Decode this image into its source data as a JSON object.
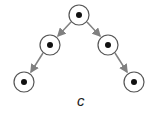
{
  "diagram": {
    "type": "binary-tree",
    "label": "c",
    "colors": {
      "node_stroke": "#555555",
      "node_dot": "#111111",
      "arrow": "#808080",
      "background": "#ffffff"
    },
    "nodes": [
      {
        "id": "root",
        "x": 79,
        "y": 15
      },
      {
        "id": "left",
        "x": 50,
        "y": 45
      },
      {
        "id": "right",
        "x": 108,
        "y": 45
      },
      {
        "id": "left-left",
        "x": 24,
        "y": 82
      },
      {
        "id": "right-right",
        "x": 134,
        "y": 82
      }
    ],
    "edges": [
      {
        "from": "root",
        "to": "left"
      },
      {
        "from": "root",
        "to": "right"
      },
      {
        "from": "left",
        "to": "left-left"
      },
      {
        "from": "right",
        "to": "right-right"
      }
    ]
  }
}
